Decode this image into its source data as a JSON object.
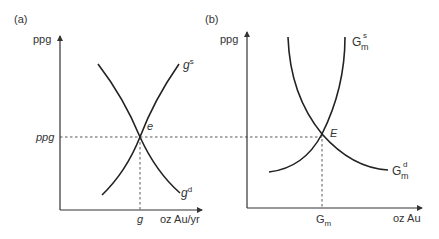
{
  "figure": {
    "panel_a": {
      "label": "(a)",
      "y_axis_label": "ppg",
      "x_axis_label": "oz Au/yr",
      "price_level_label": "ppg",
      "quantity_label": "g",
      "equilibrium_label": "e",
      "supply_curve": {
        "base": "g",
        "sup": "s"
      },
      "demand_curve": {
        "base": "g",
        "sup": "d"
      }
    },
    "panel_b": {
      "label": "(b)",
      "y_axis_label": "ppg",
      "x_axis_label": "oz Au",
      "quantity_label": {
        "base": "G",
        "sub": "m"
      },
      "equilibrium_label": "E",
      "supply_curve": {
        "base": "G",
        "sup": "s",
        "sub": "m"
      },
      "demand_curve": {
        "base": "G",
        "sup": "d",
        "sub": "m"
      }
    },
    "colors": {
      "line": "#222222",
      "text": "#333333",
      "background": "#ffffff"
    }
  }
}
